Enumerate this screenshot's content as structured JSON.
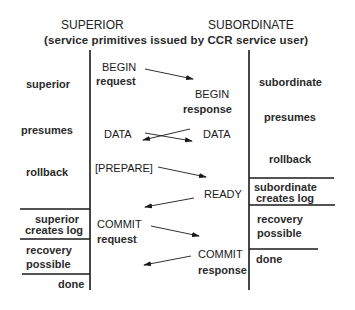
{
  "header": {
    "superior_title": "SUPERIOR",
    "subordinate_title": "SUBORDINATE",
    "subtitle": "(service primitives issued by CCR service user)"
  },
  "superior_states": [
    {
      "label": "superior"
    },
    {
      "label": "presumes"
    },
    {
      "label": "rollback"
    },
    {
      "label_line1": "superior",
      "label_line2": "creates log"
    },
    {
      "label_line1": "recovery",
      "label_line2": "possible"
    },
    {
      "label": "done"
    }
  ],
  "subordinate_states": [
    {
      "label": "subordinate"
    },
    {
      "label": "presumes"
    },
    {
      "label": "rollback"
    },
    {
      "label_line1": "subordinate",
      "label_line2": "creates log"
    },
    {
      "label_line1": "recovery",
      "label_line2": "possible"
    },
    {
      "label": "done"
    }
  ],
  "messages": [
    {
      "side": "superior",
      "line1": "BEGIN",
      "line2": "request",
      "direction": "to-subordinate"
    },
    {
      "side": "subordinate",
      "line1": "BEGIN",
      "line2": "response",
      "direction": "indication"
    },
    {
      "side": "superior",
      "line1": "DATA",
      "direction": "bidirectional"
    },
    {
      "side": "subordinate",
      "line1": "DATA",
      "direction": "bidirectional"
    },
    {
      "side": "superior",
      "line1": "[PREPARE]",
      "direction": "to-subordinate"
    },
    {
      "side": "subordinate",
      "line1": "READY",
      "direction": "to-superior"
    },
    {
      "side": "superior",
      "line1": "COMMIT",
      "line2": "request",
      "direction": "to-subordinate"
    },
    {
      "side": "subordinate",
      "line1": "COMMIT",
      "line2": "response",
      "direction": "to-superior"
    }
  ],
  "colors": {
    "line": "#1a1a1a",
    "text": "#222222",
    "background": "#ffffff"
  }
}
